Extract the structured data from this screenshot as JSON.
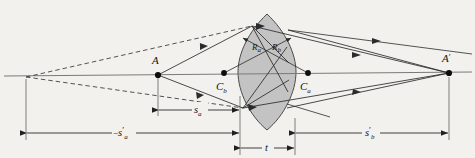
{
  "figure": {
    "type": "optics-ray-diagram",
    "background_color": "#f2f1ee",
    "line_color": "#2b2b2b",
    "lens_fill_color": "#c3c3c3",
    "lens_stroke_color": "#3a3a3a",
    "axis_color": "#6b6b6b"
  },
  "points": {
    "object": {
      "label": "A",
      "x": 158,
      "y": 75
    },
    "image": {
      "label": "A",
      "prime": "′",
      "x": 449,
      "y": 73
    },
    "center_b": {
      "label": "C",
      "subscript": "b",
      "x": 224,
      "y": 73
    },
    "center_a": {
      "label": "C",
      "subscript": "a",
      "x": 308,
      "y": 73
    },
    "virtual_vertex": {
      "label": "",
      "x": 26,
      "y": 77
    }
  },
  "radii": {
    "r_a": {
      "label": "R",
      "subscript": "a"
    },
    "r_b": {
      "label": "R",
      "subscript": "b"
    }
  },
  "dimensions": {
    "s_a": {
      "label": "s",
      "subscript": "a",
      "prime": "",
      "sign": "",
      "from_x": 158,
      "to_x": 240,
      "y": 110
    },
    "s_a_prime": {
      "label": "s",
      "subscript": "a",
      "prime": "′",
      "sign": "−",
      "from_x": 26,
      "to_x": 240,
      "y": 133
    },
    "s_b_prime": {
      "label": "s",
      "subscript": "b",
      "prime": "′",
      "sign": "",
      "from_x": 295,
      "to_x": 449,
      "y": 133
    },
    "t": {
      "label": "t",
      "subscript": "",
      "prime": "",
      "sign": "",
      "from_x": 240,
      "to_x": 295,
      "y": 148
    }
  },
  "lens": {
    "left_vertex_x": 238,
    "right_vertex_x": 296,
    "top_y": 14,
    "bottom_y": 130,
    "center_y": 72,
    "thickness_label": "t"
  }
}
